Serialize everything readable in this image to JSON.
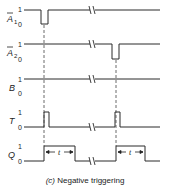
{
  "diagram": {
    "caption_label": "(c)",
    "caption_text": "Negative triggering",
    "colors": {
      "trace": "#2a2a2a",
      "guide": "#444444",
      "text": "#222222"
    },
    "signals": [
      {
        "id": "A1",
        "label": "A",
        "bar": true,
        "sub": "1",
        "one": "1",
        "zero": "0",
        "y_high": 10,
        "y_low": 24
      },
      {
        "id": "A2",
        "label": "A",
        "bar": true,
        "sub": "2",
        "one": "1",
        "zero": "0",
        "y_high": 44,
        "y_low": 59
      },
      {
        "id": "B",
        "label": "B",
        "bar": false,
        "sub": "",
        "one": "1",
        "zero": "0",
        "y_high": 79,
        "y_low": 93
      },
      {
        "id": "T",
        "label": "T",
        "bar": false,
        "sub": "",
        "one": "1",
        "zero": "0",
        "y_high": 112,
        "y_low": 127
      },
      {
        "id": "Q",
        "label": "Q",
        "bar": false,
        "sub": "",
        "one": "1",
        "zero": "0",
        "y_high": 146,
        "y_low": 161
      }
    ],
    "pulse_width_label": "t",
    "break_symbol": "//"
  }
}
